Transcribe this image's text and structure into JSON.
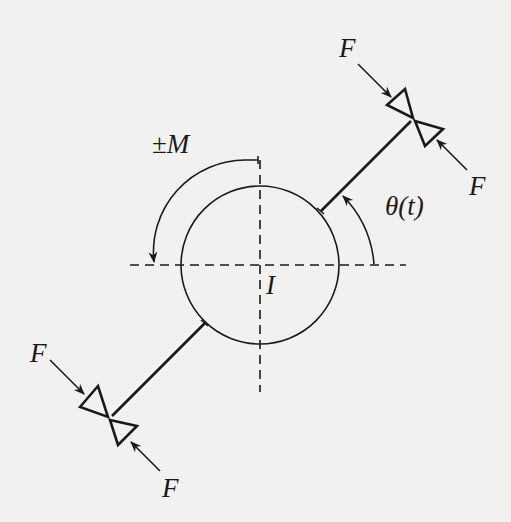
{
  "diagram": {
    "labels": {
      "moment": "±M",
      "moment_sign": "±",
      "moment_symbol": "M",
      "inertia": "I",
      "angle": "θ(t)",
      "force_top_upper": "F",
      "force_top_lower": "F",
      "force_bottom_upper": "F",
      "force_bottom_lower": "F"
    },
    "elements": {
      "body": "circle (rotor, inertia I)",
      "axes": "dashed horizontal and vertical centerlines",
      "arm": "diametral rod through center at angle θ(t)",
      "clamps": "two bow-tie clamp pairs at arm ends, each squeezed by opposing forces F",
      "moment_arrow": "curved arrow indicating ±M (counter-clockwise)",
      "angle_arrow": "curved arrow from horizontal axis to arm indicating θ(t)"
    },
    "colors": {
      "ink": "#1a1a1a",
      "paper": "#f1f1ef"
    }
  }
}
